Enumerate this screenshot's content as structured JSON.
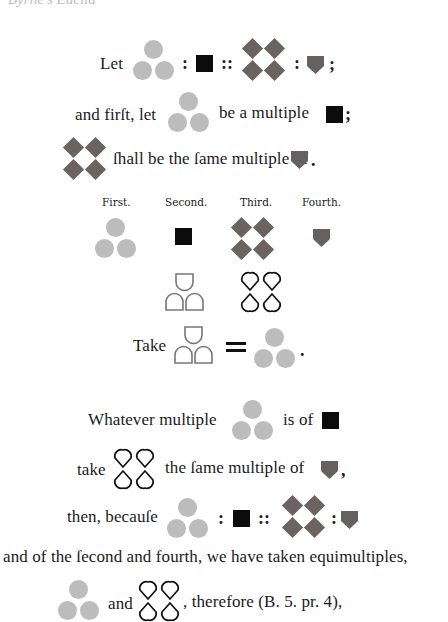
{
  "page": {
    "top_cut_text": "Byrne's Euclid",
    "colors": {
      "circle": "#bcbcbc",
      "diamond": "#6b6262",
      "square": "#0c0c0c",
      "shield": "#666060",
      "outline": "#111111",
      "arch_outline": "#777777"
    }
  },
  "line1": {
    "let": "Let",
    "colon1": ":",
    "proportion": "::",
    "colon2": ":",
    "end": ";"
  },
  "line2": {
    "lead": "and firſt, let",
    "mid": "be a multiple",
    "end": ";"
  },
  "line3": {
    "text": "ſhall be the ſame multiple of",
    "end": "."
  },
  "labels": {
    "first": "First.",
    "second": "Second.",
    "third": "Third.",
    "fourth": "Fourth."
  },
  "take_line": {
    "take": "Take",
    "equals": "=",
    "end": "."
  },
  "whatever_line": {
    "lead": "Whatever multiple",
    "mid": "is of"
  },
  "take2_line": {
    "take": "take",
    "mid": "the ſame multiple of",
    "end": ","
  },
  "because_line": {
    "lead": "then, becauſe",
    "colon1": ":",
    "proportion": "::",
    "colon2": ":"
  },
  "equimult_line": {
    "text": "and of the ſecond and fourth, we have taken equimultiples,"
  },
  "last_line": {
    "and": "and",
    "rest": ", therefore (B. 5. pr. 4),"
  },
  "icons": {
    "circle_group": "three-light-circles-icon",
    "square": "black-square-icon",
    "diamond_group": "four-dark-diamonds-icon",
    "shield": "dark-shield-icon",
    "arch_group": "three-arch-outlines-icon",
    "teardrop_group": "four-teardrop-outlines-icon"
  }
}
